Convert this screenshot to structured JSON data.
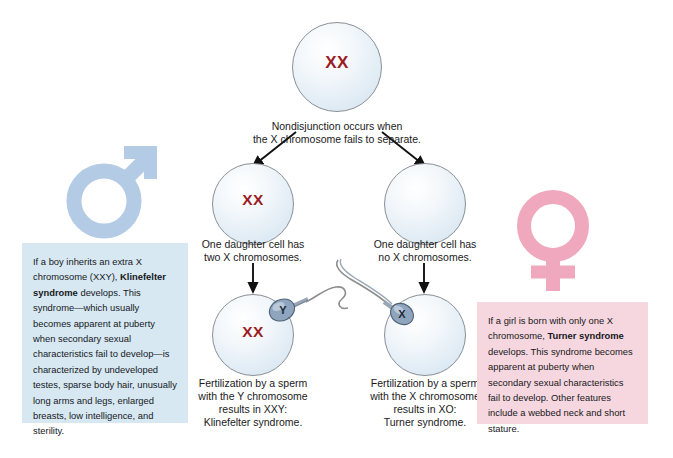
{
  "diagram": {
    "title_hidden": "Nondisjunction of X chromosome leading to Klinefelter and Turner syndromes",
    "colors": {
      "chromosome_text": "#9b1c23",
      "cell_fill": "#dce9f3",
      "cell_stroke": "#8a8f96",
      "male_symbol": "#b3cbe4",
      "female_symbol": "#efa8bd",
      "blue_box": "#d7e8f3",
      "pink_box": "#f6d7df",
      "sperm_body": "#7d94ad",
      "arrow": "#111111"
    }
  },
  "cells": {
    "parent": {
      "label": "XX"
    },
    "daughter_left": {
      "label": "XX"
    },
    "daughter_right": {
      "label": ""
    },
    "zygote_left": {
      "label": "XX"
    },
    "zygote_right": {
      "label": ""
    }
  },
  "sperm": {
    "left": {
      "chromosome": "Y"
    },
    "right": {
      "chromosome": "X"
    }
  },
  "captions": {
    "nondisjunction": "Nondisjunction occurs when\nthe X chromosome fails to separate.",
    "daughter_left": "One daughter cell has\ntwo X chromosomes.",
    "daughter_right": "One daughter cell has\nno X chromosomes.",
    "zygote_left": "Fertilization by a sperm\nwith the Y chromosome\nresults in XXY:\nKlinefelter syndrome.",
    "zygote_right": "Fertilization by a sperm\nwith the X chromosome\nresults in XO:\nTurner syndrome."
  },
  "boxes": {
    "klinefelter": {
      "part1": "If a boy inherits an extra X chromosome (XXY), ",
      "bold": "Klinefelter syndrome",
      "part2": " develops. This syndrome—which usually becomes apparent at puberty when secondary sexual characteristics fail to develop—is characterized by undeveloped testes, sparse body hair, unusually long arms and legs, enlarged breasts, low intelligence, and sterility."
    },
    "turner": {
      "part1": "If a girl is born with only one X chromosome, ",
      "bold": "Turner syndrome",
      "part2": " develops. This syndrome becomes apparent at puberty when secondary sexual characteristics fail to develop. Other features include a webbed neck and short stature."
    }
  },
  "symbols": {
    "male": "male-mars-symbol",
    "female": "female-venus-symbol"
  }
}
